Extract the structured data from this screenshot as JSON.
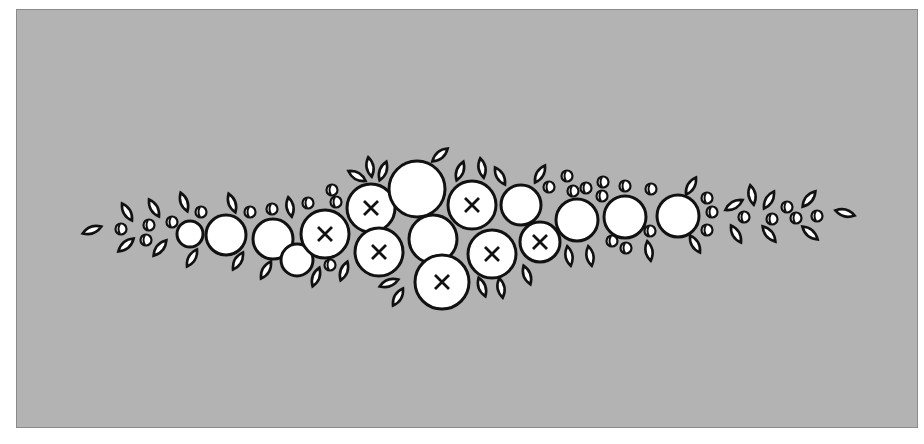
{
  "diagram": {
    "background_color": "#b3b3b3",
    "border_color": "#8a8a8a",
    "stroke_color": "#111111",
    "fill_color": "#ffffff",
    "large_circles": [
      {
        "cx": 190,
        "cy": 234,
        "r": 13,
        "marked": false
      },
      {
        "cx": 226,
        "cy": 235,
        "r": 20,
        "marked": false
      },
      {
        "cx": 273,
        "cy": 239,
        "r": 20,
        "marked": false
      },
      {
        "cx": 297,
        "cy": 260,
        "r": 16,
        "marked": false
      },
      {
        "cx": 325,
        "cy": 234,
        "r": 24,
        "marked": true
      },
      {
        "cx": 371,
        "cy": 208,
        "r": 24,
        "marked": true
      },
      {
        "cx": 379,
        "cy": 252,
        "r": 24,
        "marked": true
      },
      {
        "cx": 417,
        "cy": 189,
        "r": 28,
        "marked": false
      },
      {
        "cx": 433,
        "cy": 239,
        "r": 24,
        "marked": false
      },
      {
        "cx": 442,
        "cy": 282,
        "r": 27,
        "marked": true
      },
      {
        "cx": 472,
        "cy": 205,
        "r": 24,
        "marked": true
      },
      {
        "cx": 492,
        "cy": 254,
        "r": 24,
        "marked": true
      },
      {
        "cx": 521,
        "cy": 205,
        "r": 20,
        "marked": false
      },
      {
        "cx": 540,
        "cy": 242,
        "r": 20,
        "marked": true
      },
      {
        "cx": 577,
        "cy": 220,
        "r": 21,
        "marked": false
      },
      {
        "cx": 625,
        "cy": 217,
        "r": 21,
        "marked": false
      },
      {
        "cx": 678,
        "cy": 216,
        "r": 21,
        "marked": false
      }
    ],
    "leaves": [
      {
        "x": 92,
        "y": 230,
        "a": -20
      },
      {
        "x": 127,
        "y": 212,
        "a": 60
      },
      {
        "x": 126,
        "y": 245,
        "a": -40
      },
      {
        "x": 154,
        "y": 208,
        "a": 60
      },
      {
        "x": 160,
        "y": 248,
        "a": -50
      },
      {
        "x": 184,
        "y": 202,
        "a": 70
      },
      {
        "x": 192,
        "y": 258,
        "a": -60
      },
      {
        "x": 232,
        "y": 203,
        "a": 70
      },
      {
        "x": 238,
        "y": 261,
        "a": -60
      },
      {
        "x": 266,
        "y": 270,
        "a": -60
      },
      {
        "x": 290,
        "y": 207,
        "a": 80
      },
      {
        "x": 316,
        "y": 277,
        "a": -70
      },
      {
        "x": 344,
        "y": 271,
        "a": -70
      },
      {
        "x": 357,
        "y": 176,
        "a": 30
      },
      {
        "x": 370,
        "y": 167,
        "a": 80
      },
      {
        "x": 383,
        "y": 171,
        "a": -70
      },
      {
        "x": 389,
        "y": 283,
        "a": -20
      },
      {
        "x": 398,
        "y": 297,
        "a": -60
      },
      {
        "x": 440,
        "y": 155,
        "a": -40
      },
      {
        "x": 460,
        "y": 171,
        "a": -70
      },
      {
        "x": 482,
        "y": 168,
        "a": 80
      },
      {
        "x": 500,
        "y": 176,
        "a": 60
      },
      {
        "x": 482,
        "y": 287,
        "a": 70
      },
      {
        "x": 501,
        "y": 288,
        "a": 80
      },
      {
        "x": 527,
        "y": 275,
        "a": 70
      },
      {
        "x": 540,
        "y": 174,
        "a": -60
      },
      {
        "x": 569,
        "y": 256,
        "a": 80
      },
      {
        "x": 590,
        "y": 256,
        "a": 80
      },
      {
        "x": 649,
        "y": 251,
        "a": 80
      },
      {
        "x": 691,
        "y": 186,
        "a": -60
      },
      {
        "x": 695,
        "y": 244,
        "a": 60
      },
      {
        "x": 734,
        "y": 205,
        "a": -30
      },
      {
        "x": 752,
        "y": 195,
        "a": 80
      },
      {
        "x": 769,
        "y": 200,
        "a": -60
      },
      {
        "x": 736,
        "y": 234,
        "a": 60
      },
      {
        "x": 769,
        "y": 234,
        "a": 50
      },
      {
        "x": 809,
        "y": 199,
        "a": -50
      },
      {
        "x": 810,
        "y": 233,
        "a": 40
      },
      {
        "x": 845,
        "y": 213,
        "a": 15
      }
    ],
    "bubbles": [
      {
        "x": 121,
        "y": 229
      },
      {
        "x": 149,
        "y": 225
      },
      {
        "x": 146,
        "y": 240
      },
      {
        "x": 172,
        "y": 222
      },
      {
        "x": 201,
        "y": 212
      },
      {
        "x": 250,
        "y": 212
      },
      {
        "x": 272,
        "y": 209
      },
      {
        "x": 308,
        "y": 203
      },
      {
        "x": 332,
        "y": 190
      },
      {
        "x": 336,
        "y": 202
      },
      {
        "x": 330,
        "y": 265
      },
      {
        "x": 549,
        "y": 187
      },
      {
        "x": 567,
        "y": 176
      },
      {
        "x": 573,
        "y": 191
      },
      {
        "x": 586,
        "y": 188
      },
      {
        "x": 603,
        "y": 182
      },
      {
        "x": 602,
        "y": 196
      },
      {
        "x": 625,
        "y": 186
      },
      {
        "x": 651,
        "y": 189
      },
      {
        "x": 612,
        "y": 241
      },
      {
        "x": 626,
        "y": 248
      },
      {
        "x": 650,
        "y": 231
      },
      {
        "x": 707,
        "y": 198
      },
      {
        "x": 712,
        "y": 212
      },
      {
        "x": 707,
        "y": 230
      },
      {
        "x": 744,
        "y": 217
      },
      {
        "x": 787,
        "y": 207
      },
      {
        "x": 772,
        "y": 219
      },
      {
        "x": 796,
        "y": 218
      },
      {
        "x": 817,
        "y": 216
      }
    ]
  }
}
